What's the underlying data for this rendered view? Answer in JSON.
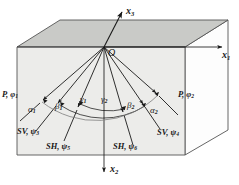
{
  "figure": {
    "type": "geometry-diagram",
    "colors": {
      "top_face": "#c9cac7",
      "front_face": "#ececea",
      "side_face": "#fdfdfd",
      "outline": "#4a4a4a",
      "ray": "#1a1a1a",
      "text": "#1a1a1a"
    }
  },
  "axes": [
    {
      "name": "x3-axis",
      "label": "x",
      "sub": "3",
      "direction": "up-right"
    },
    {
      "name": "x1-axis",
      "label": "x",
      "sub": "1",
      "direction": "right"
    },
    {
      "name": "x2-axis",
      "label": "x",
      "sub": "2",
      "direction": "down"
    }
  ],
  "origin": {
    "label": "O"
  },
  "rays": [
    {
      "name": "ray-p-left",
      "wave": "P",
      "param": "φ",
      "sub": "1"
    },
    {
      "name": "ray-sv-left",
      "wave": "SV",
      "param": "ψ",
      "sub": "3"
    },
    {
      "name": "ray-sh-left",
      "wave": "SH",
      "param": "ψ",
      "sub": "5"
    },
    {
      "name": "ray-sh-right",
      "wave": "SH",
      "param": "ψ",
      "sub": "6"
    },
    {
      "name": "ray-sv-right",
      "wave": "SV",
      "param": "ψ",
      "sub": "4"
    },
    {
      "name": "ray-p-right",
      "wave": "P",
      "param": "φ",
      "sub": "2"
    }
  ],
  "wave_labels": {
    "p_left": {
      "text": "P, φ",
      "sub": "1"
    },
    "p_right": {
      "text": "P, φ",
      "sub": "2"
    },
    "sv_left": {
      "text": "SV, ψ",
      "sub": "3"
    },
    "sv_right": {
      "text": "SV, ψ",
      "sub": "4"
    },
    "sh_left": {
      "text": "SH, ψ",
      "sub": "5"
    },
    "sh_right": {
      "text": "SH, ψ",
      "sub": "6"
    }
  },
  "angles": [
    {
      "name": "angle-alpha-1",
      "symbol": "α",
      "sub": "1"
    },
    {
      "name": "angle-beta-1",
      "symbol": "β",
      "sub": "1"
    },
    {
      "name": "angle-gamma-1",
      "symbol": "γ",
      "sub": "1"
    },
    {
      "name": "angle-gamma-2",
      "symbol": "γ",
      "sub": "2"
    },
    {
      "name": "angle-beta-2",
      "symbol": "β",
      "sub": "2"
    },
    {
      "name": "angle-alpha-2",
      "symbol": "α",
      "sub": "2"
    }
  ]
}
